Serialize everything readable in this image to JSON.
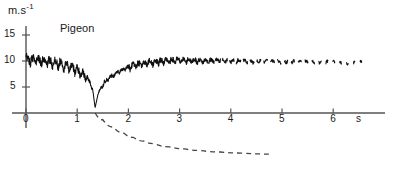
{
  "figure": {
    "series_label": "Pigeon",
    "y_axis_label": "m.s",
    "y_axis_label_exponent": "-1",
    "x_axis_unit": "s"
  },
  "chart_data": {
    "type": "line",
    "title": "Pigeon",
    "xlabel": "s",
    "ylabel": "m.s-1",
    "xlim": [
      0,
      7
    ],
    "ylim": [
      0,
      17
    ],
    "xticks": [
      0,
      1,
      2,
      3,
      4,
      5,
      6
    ],
    "xtick_labels": [
      "0",
      "1",
      "2",
      "3",
      "4",
      "5",
      "6"
    ],
    "yticks": [
      5,
      10,
      15
    ],
    "ytick_labels": [
      "5",
      "10",
      "15"
    ],
    "grid": false,
    "legend": "none",
    "annotations": [
      {
        "text": "Pigeon",
        "x": 0.7,
        "y": 15.6
      },
      {
        "text": "m.s-1",
        "x": 0.05,
        "y": 17.0
      },
      {
        "text": "s",
        "x": 6.4,
        "y": -1.2
      }
    ],
    "series": [
      {
        "name": "flight speed (wingbeat-modulated trace)",
        "style": "solid-noisy",
        "color": "#111111",
        "description": "Speed oscillates with wingbeat frequency around 10 m/s, decays during a deceleration, drops to near zero at t=1.35 s, then recovers to about 10 m/s and the record becomes intermittent after t=3.5 s.",
        "x": [
          0.0,
          0.05,
          0.1,
          0.15,
          0.2,
          0.25,
          0.3,
          0.35,
          0.4,
          0.45,
          0.5,
          0.55,
          0.6,
          0.65,
          0.7,
          0.75,
          0.8,
          0.85,
          0.9,
          0.95,
          1.0,
          1.05,
          1.1,
          1.15,
          1.2,
          1.25,
          1.3,
          1.35,
          1.4,
          1.45,
          1.5,
          1.55,
          1.6,
          1.65,
          1.7,
          1.75,
          1.8,
          1.85,
          1.9,
          1.95,
          2.0,
          2.1,
          2.2,
          2.3,
          2.4,
          2.5,
          2.6,
          2.7,
          2.8,
          2.9,
          3.0,
          3.2,
          3.4,
          3.6,
          3.8,
          4.0,
          4.2,
          4.4,
          4.6,
          4.8,
          5.0,
          5.2,
          5.4,
          5.6,
          5.8,
          6.0,
          6.2,
          6.4,
          6.6
        ],
        "y": [
          10.3,
          10.2,
          10.4,
          10.1,
          10.3,
          10.0,
          10.2,
          9.9,
          10.1,
          9.8,
          9.9,
          9.6,
          9.7,
          9.4,
          9.5,
          9.1,
          9.2,
          8.8,
          8.9,
          8.4,
          8.3,
          7.8,
          7.6,
          7.0,
          6.6,
          5.8,
          4.6,
          1.0,
          3.4,
          4.6,
          5.4,
          6.0,
          6.5,
          6.9,
          7.3,
          7.6,
          7.9,
          8.1,
          8.4,
          8.6,
          8.8,
          9.1,
          9.3,
          9.5,
          9.7,
          9.8,
          9.9,
          10.0,
          10.0,
          10.1,
          10.1,
          10.1,
          10.0,
          10.0,
          10.1,
          10.0,
          10.0,
          9.9,
          10.0,
          9.9,
          9.9,
          9.9,
          9.8,
          9.9,
          9.8,
          9.8,
          9.7,
          9.8,
          9.7
        ],
        "noise_amplitude_start": 1.1,
        "noise_amplitude_end": 0.35
      },
      {
        "name": "reference decay curve",
        "style": "dashed",
        "color": "#444444",
        "description": "Dashed curve beginning at the time axis near t=1.35 s, falling steeply below the axis and flattening asymptotically, ending near t=4.8 s.",
        "x": [
          1.35,
          1.5,
          1.7,
          1.9,
          2.1,
          2.3,
          2.5,
          2.8,
          3.1,
          3.4,
          3.8,
          4.2,
          4.8
        ],
        "y": [
          0.0,
          -1.3,
          -2.7,
          -3.8,
          -4.7,
          -5.4,
          -5.9,
          -6.5,
          -6.9,
          -7.2,
          -7.5,
          -7.7,
          -7.9
        ]
      }
    ]
  }
}
